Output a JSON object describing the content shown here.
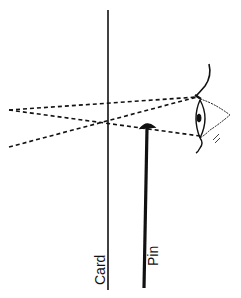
{
  "diagram": {
    "labels": {
      "card": "Card",
      "pin": "Pin"
    },
    "elements": [
      "card-line",
      "pin",
      "eye",
      "sight-lines"
    ],
    "colors": {
      "ink": "#111111",
      "background": "#ffffff"
    }
  }
}
